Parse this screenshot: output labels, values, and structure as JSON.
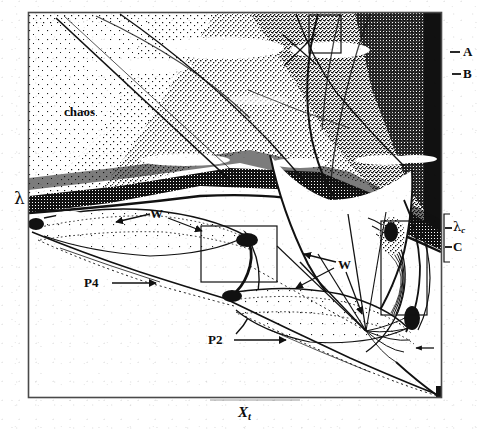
{
  "figure": {
    "type": "bifurcation-diagram",
    "caption_present": false,
    "axes": {
      "y_label": "λ",
      "x_label_base": "X",
      "x_label_sub": "t"
    },
    "frame": {
      "left": 28,
      "top": 12,
      "right": 442,
      "bottom": 398
    },
    "right_scale_labels": [
      {
        "id": "A",
        "text": "A",
        "y": 52,
        "tick": true
      },
      {
        "id": "B",
        "text": "B",
        "y": 74,
        "tick": true
      },
      {
        "id": "lc",
        "text": "λ",
        "sub": "c",
        "y": 228,
        "tick": true
      },
      {
        "id": "C",
        "text": "C",
        "y": 247,
        "tick": true
      }
    ],
    "interior_labels": [
      {
        "id": "chaos",
        "text": "chaos",
        "x": 64,
        "y": 112
      },
      {
        "id": "w-upper",
        "text": "W",
        "x": 152,
        "y": 214
      },
      {
        "id": "w-lower",
        "text": "W",
        "x": 340,
        "y": 265
      },
      {
        "id": "p4",
        "text": "P4",
        "x": 88,
        "y": 283
      },
      {
        "id": "p2",
        "text": "P2",
        "x": 212,
        "y": 340
      }
    ],
    "annotation_boxes": [
      {
        "id": "box-top",
        "x": 309,
        "y": 15,
        "w": 32,
        "h": 38
      },
      {
        "id": "box-mid",
        "x": 201,
        "y": 226,
        "w": 76,
        "h": 56
      },
      {
        "id": "box-right",
        "x": 381,
        "y": 221,
        "w": 46,
        "h": 94
      }
    ],
    "colors": {
      "ink": "#0d0d0d",
      "paper": "#ffffff",
      "frame": "#4a4a4a"
    }
  }
}
